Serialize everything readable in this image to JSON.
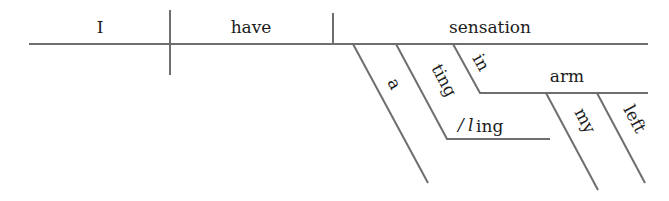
{
  "diagram": {
    "type": "Reed-Kellogg sentence diagram",
    "sentence_words": [
      "I",
      "have",
      "a",
      "tingling",
      "sensation",
      "in",
      "my",
      "left",
      "arm"
    ],
    "baseline": {
      "subject": "I",
      "verb": "have",
      "direct_object": "sensation"
    },
    "modifiers": {
      "article": "a",
      "participle_part1": "ting",
      "participle_part2": "ing",
      "participle_full": "tingling",
      "preposition": "in",
      "prep_object": "arm",
      "possessive": "my",
      "adjective": "left"
    },
    "line_color": "#6e6e6e",
    "text_color": "#1c1c1c"
  }
}
